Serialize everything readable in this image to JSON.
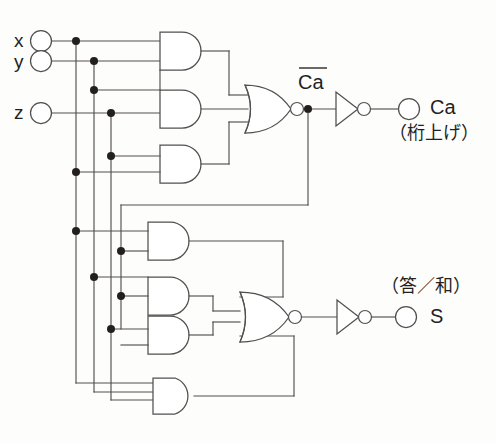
{
  "diagram": {
    "width": 496,
    "height": 444,
    "background_color": "#fdfdfc",
    "line_color": "#52504f",
    "junction_color": "#241f1f",
    "text_color": "#241f1f"
  },
  "inputs": [
    {
      "id": "x",
      "label": "x",
      "x": 40,
      "y": 41
    },
    {
      "id": "y",
      "label": "y",
      "x": 40,
      "y": 61
    },
    {
      "id": "z",
      "label": "z",
      "x": 40,
      "y": 113
    }
  ],
  "outputs": [
    {
      "id": "Ca",
      "label": "Ca",
      "sub_label": "（桁上げ）",
      "terminal_x": 409,
      "terminal_y": 103
    },
    {
      "id": "S",
      "label": "S",
      "sub_label": "（答／和）",
      "terminal_x": 406,
      "terminal_y": 317
    }
  ],
  "internal_labels": [
    {
      "id": "Ca-bar",
      "label": "Ca",
      "has_overbar": true,
      "x": 300,
      "y": 73
    }
  ],
  "gates": [
    {
      "id": "and1",
      "type": "AND",
      "inputs": 2,
      "x": 155,
      "y": 32,
      "w": 45,
      "h": 38,
      "section": "carry"
    },
    {
      "id": "and2",
      "type": "AND",
      "inputs": 2,
      "x": 155,
      "y": 90,
      "w": 45,
      "h": 38,
      "section": "carry"
    },
    {
      "id": "and3",
      "type": "AND",
      "inputs": 2,
      "x": 155,
      "y": 145,
      "w": 45,
      "h": 38,
      "section": "carry"
    },
    {
      "id": "nor1",
      "type": "NOR",
      "inputs": 3,
      "x": 243,
      "y": 85,
      "w": 48,
      "h": 42,
      "section": "carry"
    },
    {
      "id": "inv1",
      "type": "NOT",
      "inputs": 1,
      "x": 336,
      "y": 92,
      "w": 26,
      "h": 22,
      "section": "carry"
    },
    {
      "id": "and4",
      "type": "AND",
      "inputs": 2,
      "x": 143,
      "y": 222,
      "w": 45,
      "h": 38,
      "section": "sum"
    },
    {
      "id": "and5",
      "type": "AND",
      "inputs": 2,
      "x": 143,
      "y": 277,
      "w": 45,
      "h": 38,
      "section": "sum"
    },
    {
      "id": "and6",
      "type": "AND",
      "inputs": 2,
      "x": 143,
      "y": 316,
      "w": 45,
      "h": 38,
      "section": "sum"
    },
    {
      "id": "and7",
      "type": "AND",
      "inputs": 3,
      "x": 150,
      "y": 378,
      "w": 45,
      "h": 38,
      "section": "sum"
    },
    {
      "id": "nor2",
      "type": "NOR",
      "inputs": 4,
      "x": 240,
      "y": 292,
      "w": 48,
      "h": 50,
      "section": "sum"
    },
    {
      "id": "inv2",
      "type": "NOT",
      "inputs": 1,
      "x": 337,
      "y": 306,
      "w": 26,
      "h": 22,
      "section": "sum"
    }
  ],
  "buses": [
    {
      "id": "x-bus",
      "label": "x",
      "x": 76
    },
    {
      "id": "y-bus",
      "label": "y",
      "x": 94
    },
    {
      "id": "z-bus",
      "label": "z",
      "x": 111
    },
    {
      "id": "cabar-bus",
      "label": "Ca-bar",
      "x": 121
    }
  ],
  "junction_count": 12
}
